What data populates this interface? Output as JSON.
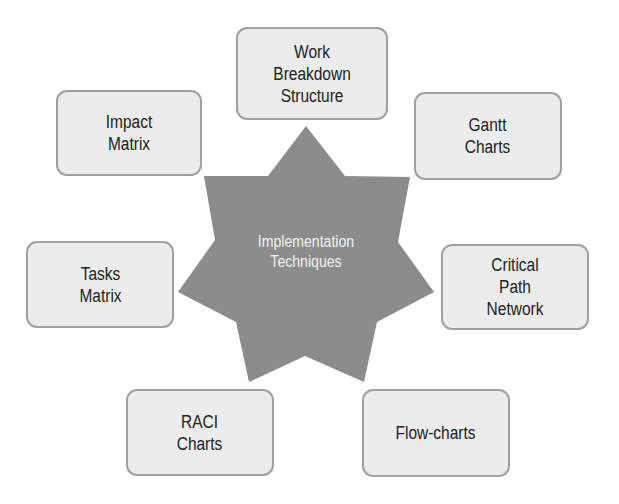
{
  "center": {
    "label": "Implementation\nTechniques",
    "line1": "Implementation",
    "line2": "Techniques",
    "shape": "seven-point-star",
    "color": "#8c8c8c"
  },
  "nodes": [
    {
      "id": "wbs",
      "label": "Work\nBreakdown\nStructure"
    },
    {
      "id": "gantt",
      "label": "Gantt\nCharts"
    },
    {
      "id": "critical-path",
      "label": "Critical\nPath\nNetwork"
    },
    {
      "id": "flow-charts",
      "label": "Flow-charts"
    },
    {
      "id": "raci",
      "label": "RACI\nCharts"
    },
    {
      "id": "tasks-matrix",
      "label": "Tasks\nMatrix"
    },
    {
      "id": "impact-matrix",
      "label": "Impact\nMatrix"
    }
  ],
  "colors": {
    "node_fill": "#ececec",
    "node_border": "#a0a0a0",
    "text": "#222222",
    "center_text": "#f2f2f2"
  }
}
